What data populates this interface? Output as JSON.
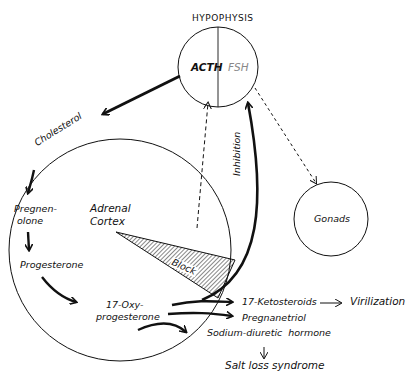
{
  "diagram": {
    "nodes": {
      "hypophysis": {
        "title": "HYPOPHYSIS",
        "left_label": "ACTH",
        "right_label": "FSH"
      },
      "adrenal": {
        "label_line1": "Adrenal",
        "label_line2": "Cortex",
        "steps": {
          "cholesterol": "Cholesterol",
          "pregnenolone_line1": "Pregnen-",
          "pregnenolone_line2": "olone",
          "progesterone": "Progesterone",
          "oxyprogesterone_line1": "17-Oxy-",
          "oxyprogesterone_line2": "progesterone"
        },
        "block_label": "Block"
      },
      "gonads": {
        "label": "Gonads"
      }
    },
    "edges": {
      "inhibition_label": "Inhibition"
    },
    "outputs": {
      "ketosteroids": "17-Ketosteroids",
      "virilization": "Virilization",
      "pregnanetriol": "Pregnanetriol",
      "sodium_diuretic": "Sodium-diuretic  hormone",
      "salt_loss": "Salt loss syndrome"
    },
    "colors": {
      "line": "#111111",
      "fsh_text": "#888888",
      "background": "#ffffff"
    }
  }
}
